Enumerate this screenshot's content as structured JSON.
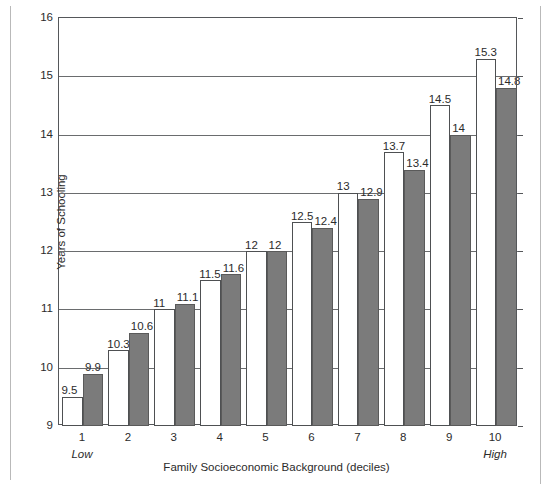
{
  "chart_data": {
    "type": "bar",
    "title": "",
    "xlabel": "Family Socioeconomic Background (deciles)",
    "ylabel": "Years of Schooling",
    "categories": [
      "1",
      "2",
      "3",
      "4",
      "5",
      "6",
      "7",
      "8",
      "9",
      "10"
    ],
    "series": [
      {
        "name": "light",
        "values": [
          9.5,
          10.3,
          11,
          11.5,
          12,
          12.5,
          13,
          13.7,
          14.5,
          15.3
        ],
        "labels": [
          "9.5",
          "10.3",
          "11",
          "11.5",
          "12",
          "12.5",
          "13",
          "13.7",
          "14.5",
          "15.3"
        ],
        "color": "#ffffff"
      },
      {
        "name": "dark",
        "values": [
          9.9,
          10.6,
          11.1,
          11.6,
          12,
          12.4,
          12.9,
          13.4,
          14,
          14.8
        ],
        "labels": [
          "9.9",
          "10.6",
          "11.1",
          "11.6",
          "12",
          "12.4",
          "12.9",
          "13.4",
          "14",
          "14.8"
        ],
        "color": "#7b7b7b"
      }
    ],
    "ylim": [
      9,
      16
    ],
    "yticks": [
      9,
      10,
      11,
      12,
      13,
      14,
      15,
      16
    ],
    "ytick_labels": [
      "9",
      "10",
      "11",
      "12",
      "13",
      "14",
      "15",
      "16"
    ],
    "grid": true,
    "legend": "none",
    "axis_anchors": {
      "low": "Low",
      "high": "High"
    }
  }
}
